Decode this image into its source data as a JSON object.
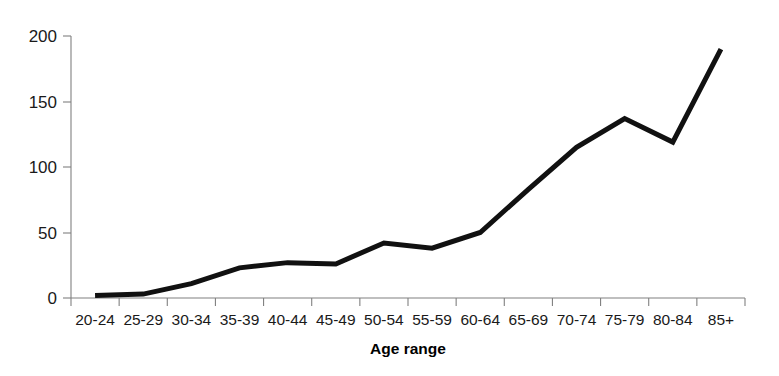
{
  "chart_data": {
    "type": "line",
    "title": "",
    "subtitle": "",
    "xlabel": "Age range",
    "ylabel": "",
    "categories": [
      "20-24",
      "25-29",
      "30-34",
      "35-39",
      "40-44",
      "45-49",
      "50-54",
      "55-59",
      "60-64",
      "65-69",
      "70-74",
      "75-79",
      "80-84",
      "85+"
    ],
    "values": [
      2,
      3,
      11,
      23,
      27,
      26,
      42,
      38,
      50,
      83,
      115,
      137,
      119,
      190
    ],
    "series": [
      {
        "name": "",
        "values": [
          2,
          3,
          11,
          23,
          27,
          26,
          42,
          38,
          50,
          83,
          115,
          137,
          119,
          190
        ]
      }
    ],
    "ylim": [
      0,
      200
    ],
    "yticks": [
      0,
      50,
      100,
      150,
      200
    ],
    "ytick_labels": [
      "0",
      "50",
      "100",
      "150",
      "200"
    ],
    "grid": false,
    "legend": false,
    "legend_position": "none",
    "line_color": "#111111",
    "axis_color": "#808080",
    "background_color": "#ffffff"
  },
  "axes": {
    "x_axis_title": "Age range",
    "y_axis_title": ""
  }
}
